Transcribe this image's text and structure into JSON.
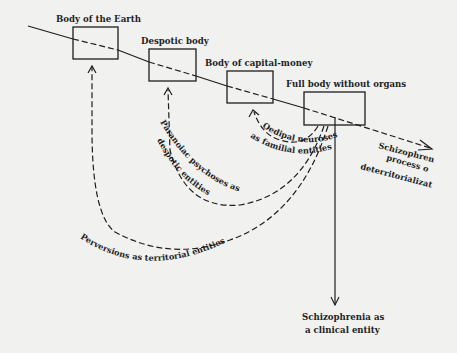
{
  "diagram": {
    "bodies": [
      {
        "label": "Body of the Earth"
      },
      {
        "label": "Despotic body"
      },
      {
        "label": "Body of capital-money"
      },
      {
        "label": "Full body without organs"
      }
    ],
    "process": {
      "line1": "Schizophrenic",
      "line2": "process of",
      "line3": "deterritorialization"
    },
    "curves": [
      {
        "text": "Oedipal neuroses",
        "text2": "as familial entities"
      },
      {
        "text": "Paranoiac psychoses as",
        "text2": "despotic entities"
      },
      {
        "text": "Perversions as territorial entities"
      }
    ],
    "clinical": {
      "line1": "Schizophrenia as",
      "line2": "a clinical entity"
    },
    "colors": {
      "ink": "#1e1e1e",
      "paper": "#f1f1ef"
    }
  }
}
